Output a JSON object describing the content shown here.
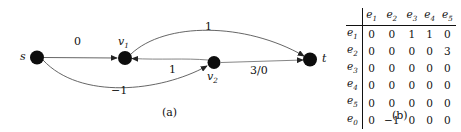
{
  "figure": {
    "panel_a": {
      "caption": "(a)",
      "nodes": [
        {
          "id": "s",
          "label": "s",
          "sub": "",
          "x": 37,
          "y": 57
        },
        {
          "id": "v1",
          "label": "v",
          "sub": "1",
          "x": 125,
          "y": 58
        },
        {
          "id": "v2",
          "label": "v",
          "sub": "2",
          "x": 214,
          "y": 63
        },
        {
          "id": "t",
          "label": "t",
          "sub": "",
          "x": 310,
          "y": 60
        }
      ],
      "edges": [
        {
          "from": "s",
          "to": "v1",
          "label": "0",
          "shape": "straight"
        },
        {
          "from": "s",
          "to": "v2",
          "label": "-1",
          "shape": "curve-down"
        },
        {
          "from": "v1",
          "to": "t",
          "label": "1",
          "shape": "curve-up"
        },
        {
          "from": "v2",
          "to": "v1",
          "label": "1",
          "shape": "curve-up-small"
        },
        {
          "from": "v2",
          "to": "t",
          "label": "3/0",
          "shape": "straight"
        }
      ],
      "edge_labels": [
        {
          "text": "0",
          "x": 78,
          "y": 42
        },
        {
          "text": "1",
          "x": 208,
          "y": 27
        },
        {
          "text": "1",
          "x": 172,
          "y": 70
        },
        {
          "text": "−1",
          "x": 118,
          "y": 92
        },
        {
          "text": "3/0",
          "x": 262,
          "y": 71
        }
      ],
      "node_colors": {
        "fill": "#0d0d0d",
        "edge": "#4d4d4d"
      }
    },
    "panel_b": {
      "caption": "(b)",
      "columns": [
        "e₁",
        "e₂",
        "e₃",
        "e₄",
        "e₅"
      ],
      "column_heads": [
        {
          "base": "e",
          "sub": "1"
        },
        {
          "base": "e",
          "sub": "2"
        },
        {
          "base": "e",
          "sub": "3"
        },
        {
          "base": "e",
          "sub": "4"
        },
        {
          "base": "e",
          "sub": "5"
        }
      ],
      "row_heads": [
        {
          "base": "e",
          "sub": "1"
        },
        {
          "base": "e",
          "sub": "2"
        },
        {
          "base": "e",
          "sub": "3"
        },
        {
          "base": "e",
          "sub": "4"
        },
        {
          "base": "e",
          "sub": "5"
        },
        {
          "base": "e",
          "sub": "0"
        }
      ],
      "rows": [
        {
          "head": "e₁",
          "values": [
            "0",
            "0",
            "1",
            "1",
            "0"
          ]
        },
        {
          "head": "e₂",
          "values": [
            "0",
            "0",
            "0",
            "0",
            "3"
          ]
        },
        {
          "head": "e₃",
          "values": [
            "0",
            "0",
            "0",
            "0",
            "0"
          ]
        },
        {
          "head": "e₄",
          "values": [
            "0",
            "0",
            "0",
            "0",
            "0"
          ]
        },
        {
          "head": "e₅",
          "values": [
            "0",
            "0",
            "0",
            "0",
            "0"
          ]
        },
        {
          "head": "e₀",
          "values": [
            "0",
            "−1",
            "0",
            "0",
            "0"
          ]
        }
      ]
    }
  }
}
